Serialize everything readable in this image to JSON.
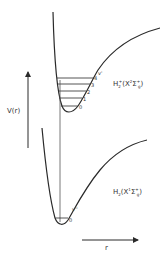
{
  "diagram": {
    "type": "potential-energy-curves",
    "line_color": "#2a2a2a",
    "axes": {
      "y_label": "V(r)",
      "x_label": "r"
    },
    "upper_state": {
      "label_main": "H",
      "label_sub": "2",
      "label_sup": "+",
      "label_term": "(X",
      "label_term_sup": "2",
      "label_sigma": "Σ",
      "label_sigma_sup": "+",
      "label_sigma_sub": "g",
      "label_close": ")",
      "vib_label": "v'",
      "levels": [
        "0",
        "1",
        "2",
        "3",
        "4"
      ]
    },
    "lower_state": {
      "label_main": "H",
      "label_sub": "2",
      "label_term": "(X",
      "label_term_sup": "1",
      "label_sigma": "Σ",
      "label_sigma_sup": "+",
      "label_sigma_sub": "g",
      "label_close": ")",
      "vib_label": "v''",
      "levels": [
        "0"
      ]
    }
  }
}
